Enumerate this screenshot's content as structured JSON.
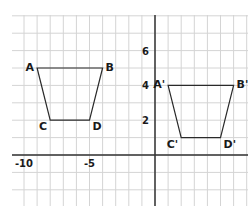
{
  "diagram": {
    "type": "coordinate-grid-translation",
    "grid": {
      "x_min": -11,
      "x_max": 7,
      "y_min": -3,
      "y_max": 8,
      "grid_color": "#d4d4d4",
      "axis_color": "#333333",
      "line_color": "#2a2a2a"
    },
    "axis_tick_labels": {
      "x": [
        {
          "value": -10,
          "label": "-10"
        },
        {
          "value": -5,
          "label": "-5"
        }
      ],
      "y": [
        {
          "value": 2,
          "label": "2"
        },
        {
          "value": 4,
          "label": "4"
        },
        {
          "value": 6,
          "label": "6"
        }
      ]
    },
    "shapes": [
      {
        "name": "ABCD",
        "vertices": [
          {
            "label": "A",
            "x": -9,
            "y": 5
          },
          {
            "label": "B",
            "x": -4,
            "y": 5
          },
          {
            "label": "D",
            "x": -5,
            "y": 2
          },
          {
            "label": "C",
            "x": -8,
            "y": 2
          }
        ]
      },
      {
        "name": "A'B'C'D'",
        "vertices": [
          {
            "label": "A'",
            "x": 1,
            "y": 4
          },
          {
            "label": "B'",
            "x": 6,
            "y": 4
          },
          {
            "label": "D'",
            "x": 5,
            "y": 1
          },
          {
            "label": "C'",
            "x": 2,
            "y": 1
          }
        ]
      }
    ]
  }
}
